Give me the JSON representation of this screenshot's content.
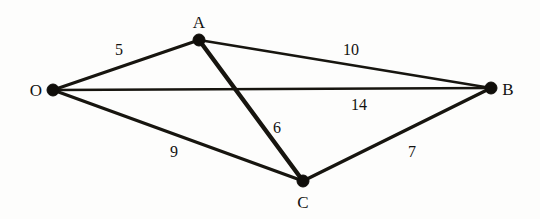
{
  "figure": {
    "background_color": "#fdfdfc",
    "ink_color": "#17150f"
  },
  "chart_data": {
    "type": "diagram",
    "graph_type": "weighted-undirected-graph",
    "title": "",
    "nodes": [
      {
        "id": "O",
        "label": "O",
        "x": 53,
        "y": 90,
        "label_x": 36,
        "label_y": 90,
        "label_pos": "left"
      },
      {
        "id": "A",
        "label": "A",
        "x": 199,
        "y": 40,
        "label_x": 199,
        "label_y": 22,
        "label_pos": "above"
      },
      {
        "id": "B",
        "label": "B",
        "x": 491,
        "y": 88,
        "label_x": 508,
        "label_y": 89,
        "label_pos": "right"
      },
      {
        "id": "C",
        "label": "C",
        "x": 303,
        "y": 181,
        "label_x": 303,
        "label_y": 202,
        "label_pos": "below"
      }
    ],
    "edges": [
      {
        "from": "O",
        "to": "A",
        "weight": 5,
        "label": "5",
        "label_x": 119,
        "label_y": 50,
        "thickness": 3.0
      },
      {
        "from": "A",
        "to": "B",
        "weight": 10,
        "label": "10",
        "label_x": 351,
        "label_y": 50,
        "thickness": 2.6
      },
      {
        "from": "O",
        "to": "B",
        "weight": 14,
        "label": "14",
        "label_x": 359,
        "label_y": 105,
        "thickness": 2.4
      },
      {
        "from": "A",
        "to": "C",
        "weight": 6,
        "label": "6",
        "label_x": 277,
        "label_y": 128,
        "thickness": 4.4
      },
      {
        "from": "O",
        "to": "C",
        "weight": 9,
        "label": "9",
        "label_x": 174,
        "label_y": 152,
        "thickness": 3.2
      },
      {
        "from": "C",
        "to": "B",
        "weight": 7,
        "label": "7",
        "label_x": 412,
        "label_y": 152,
        "thickness": 3.4
      }
    ],
    "weights": [
      5,
      10,
      14,
      6,
      9,
      7
    ],
    "node_ids": [
      "O",
      "A",
      "B",
      "C"
    ],
    "node_radius": 6
  }
}
